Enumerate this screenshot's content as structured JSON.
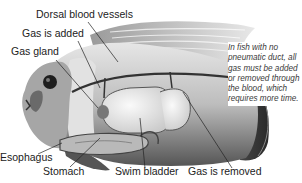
{
  "labels": {
    "dorsal_blood_vessels": "Dorsal blood vessels",
    "gas_is_added": "Gas is added",
    "gas_gland": "Gas gland",
    "esophagus": "Esophagus",
    "stomach": "Stomach",
    "swim_bladder": "Swim bladder",
    "gas_is_removed": "Gas is removed"
  },
  "note": "In fish with no pneumatic duct, all gas must be added or removed through the blood, which requires more time.",
  "colors": {
    "body_dark": "#3a3a3a",
    "body_mid": "#8a8a8a",
    "body_light": "#d8d8d8",
    "bladder": "#efefef",
    "label_text": "#222222",
    "note_text": "#3a3a3a"
  }
}
